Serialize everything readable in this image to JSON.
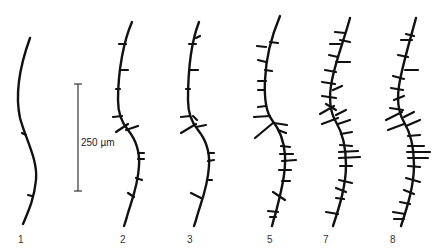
{
  "figure": {
    "scale_bar": {
      "label": "250 µm"
    },
    "panels": [
      {
        "label": "1"
      },
      {
        "label": "2"
      },
      {
        "label": "3"
      },
      {
        "label": "5"
      },
      {
        "label": "7"
      },
      {
        "label": "8"
      }
    ]
  }
}
